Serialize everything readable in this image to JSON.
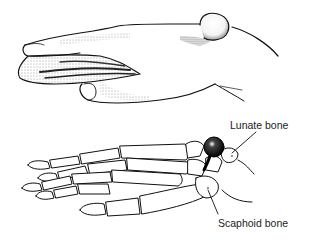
{
  "figure": {
    "top_panel": "hand-exterior-view",
    "bottom_panel": "hand-skeleton-view",
    "labels": {
      "lunate": "Lunate bone",
      "scaphoid": "Scaphoid bone"
    },
    "colors": {
      "ink": "#111111",
      "paper": "#ffffff",
      "label_text": "#222222"
    }
  }
}
